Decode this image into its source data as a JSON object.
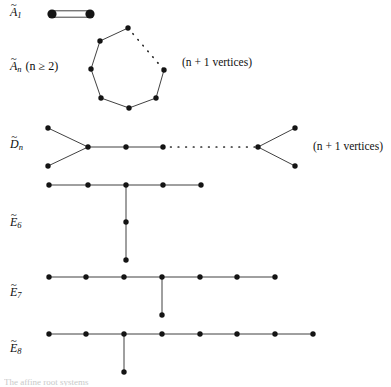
{
  "figure": {
    "width": 391,
    "height": 387,
    "node_color": "#141414",
    "edge_color": "#2b2b2b",
    "background": "#ffffff",
    "bottom_caption": "The affine root systems"
  },
  "rows": [
    {
      "id": "A1",
      "label_tilde": "~",
      "label_base": "A",
      "label_sub": "1",
      "label_condition": "",
      "side_note": "",
      "type": "double-edge",
      "node_count": 2,
      "nodes": [
        {
          "x": 52,
          "y": 14
        },
        {
          "x": 90,
          "y": 14
        }
      ]
    },
    {
      "id": "An",
      "label_tilde": "~",
      "label_base": "A",
      "label_sub": "n",
      "label_condition": "(n ≥ 2)",
      "side_note": "(n + 1 vertices)",
      "type": "cycle",
      "node_count": 7,
      "nodes": [
        {
          "x": 128,
          "y": 28
        },
        {
          "x": 100,
          "y": 41
        },
        {
          "x": 91,
          "y": 69
        },
        {
          "x": 101,
          "y": 98
        },
        {
          "x": 129,
          "y": 108
        },
        {
          "x": 156,
          "y": 98
        },
        {
          "x": 164,
          "y": 70
        }
      ],
      "solid_edges": [
        [
          0,
          1
        ],
        [
          1,
          2
        ],
        [
          2,
          3
        ],
        [
          3,
          4
        ],
        [
          4,
          5
        ],
        [
          5,
          6
        ]
      ],
      "dotted_edges": [
        [
          0,
          6
        ]
      ]
    },
    {
      "id": "Dn",
      "label_tilde": "~",
      "label_base": "D",
      "label_sub": "n",
      "label_condition": "",
      "side_note": "(n + 1 vertices)",
      "type": "double-fork-chain",
      "node_count": 8,
      "nodes": [
        {
          "x": 48,
          "y": 128
        },
        {
          "x": 48,
          "y": 166
        },
        {
          "x": 88,
          "y": 147
        },
        {
          "x": 126,
          "y": 147
        },
        {
          "x": 163,
          "y": 147
        },
        {
          "x": 258,
          "y": 147
        },
        {
          "x": 295,
          "y": 128
        },
        {
          "x": 295,
          "y": 166
        }
      ],
      "solid_edges": [
        [
          0,
          2
        ],
        [
          1,
          2
        ],
        [
          2,
          3
        ],
        [
          3,
          4
        ],
        [
          5,
          6
        ],
        [
          5,
          7
        ]
      ],
      "dotted_edges": [
        [
          4,
          5
        ]
      ]
    },
    {
      "id": "E6",
      "label_tilde": "~",
      "label_base": "E",
      "label_sub": "6",
      "label_condition": "",
      "side_note": "",
      "type": "tree",
      "node_count": 7,
      "nodes": [
        {
          "x": 49,
          "y": 185
        },
        {
          "x": 88,
          "y": 185
        },
        {
          "x": 126,
          "y": 185
        },
        {
          "x": 163,
          "y": 185
        },
        {
          "x": 201,
          "y": 185
        },
        {
          "x": 126,
          "y": 222
        },
        {
          "x": 126,
          "y": 260
        }
      ],
      "solid_edges": [
        [
          0,
          1
        ],
        [
          1,
          2
        ],
        [
          2,
          3
        ],
        [
          3,
          4
        ],
        [
          2,
          5
        ],
        [
          5,
          6
        ]
      ],
      "dotted_edges": []
    },
    {
      "id": "E7",
      "label_tilde": "~",
      "label_base": "E",
      "label_sub": "7",
      "label_condition": "",
      "side_note": "",
      "type": "tree",
      "node_count": 8,
      "nodes": [
        {
          "x": 49,
          "y": 277
        },
        {
          "x": 86,
          "y": 277
        },
        {
          "x": 124,
          "y": 277
        },
        {
          "x": 162,
          "y": 277
        },
        {
          "x": 200,
          "y": 277
        },
        {
          "x": 237,
          "y": 277
        },
        {
          "x": 275,
          "y": 277
        },
        {
          "x": 162,
          "y": 315
        }
      ],
      "solid_edges": [
        [
          0,
          1
        ],
        [
          1,
          2
        ],
        [
          2,
          3
        ],
        [
          3,
          4
        ],
        [
          4,
          5
        ],
        [
          5,
          6
        ],
        [
          3,
          7
        ]
      ],
      "dotted_edges": []
    },
    {
      "id": "E8",
      "label_tilde": "~",
      "label_base": "E",
      "label_sub": "8",
      "label_condition": "",
      "side_note": "",
      "type": "tree",
      "node_count": 9,
      "nodes": [
        {
          "x": 49,
          "y": 334
        },
        {
          "x": 86,
          "y": 334
        },
        {
          "x": 124,
          "y": 334
        },
        {
          "x": 162,
          "y": 334
        },
        {
          "x": 200,
          "y": 334
        },
        {
          "x": 237,
          "y": 334
        },
        {
          "x": 275,
          "y": 334
        },
        {
          "x": 313,
          "y": 334
        },
        {
          "x": 124,
          "y": 372
        }
      ],
      "solid_edges": [
        [
          0,
          1
        ],
        [
          1,
          2
        ],
        [
          2,
          3
        ],
        [
          3,
          4
        ],
        [
          4,
          5
        ],
        [
          5,
          6
        ],
        [
          6,
          7
        ],
        [
          2,
          8
        ]
      ],
      "dotted_edges": []
    }
  ],
  "labels": {
    "a1": {
      "tilde": "~",
      "base": "A",
      "sub": "1",
      "cond": "",
      "x": 10,
      "y": 8
    },
    "an": {
      "tilde": "~",
      "base": "A",
      "sub": "n",
      "cond": "(n ≥ 2)",
      "x": 10,
      "y": 62
    },
    "dn": {
      "tilde": "~",
      "base": "D",
      "sub": "n",
      "cond": "",
      "x": 10,
      "y": 140
    },
    "e6": {
      "tilde": "~",
      "base": "E",
      "sub": "6",
      "cond": "",
      "x": 10,
      "y": 218
    },
    "e7": {
      "tilde": "~",
      "base": "E",
      "sub": "7",
      "cond": "",
      "x": 10,
      "y": 288
    },
    "e8": {
      "tilde": "~",
      "base": "E",
      "sub": "8",
      "cond": "",
      "x": 10,
      "y": 344
    }
  },
  "side_notes": {
    "an_note": "(n + 1 vertices)",
    "dn_note": "(n + 1 vertices)"
  }
}
